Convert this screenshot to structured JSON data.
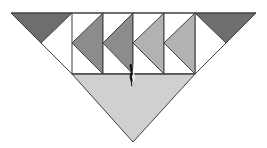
{
  "diagram": {
    "type": "quilt-block-geometric",
    "width": 267,
    "height": 148,
    "colors": {
      "background": "#ffffff",
      "stroke": "#404040",
      "dark": "#6e6e6e",
      "medium": "#8c8c8c",
      "light": "#b2b2b2",
      "base": "#d0d0d0"
    },
    "corner_triangles": [
      {
        "points": "11,13 72,13 41,43",
        "fill": "dark"
      },
      {
        "points": "195,13 256,13 226,43",
        "fill": "dark"
      }
    ],
    "panels": [
      {
        "x": 72,
        "y": 13,
        "w": 31,
        "h": 61,
        "arrow_points": "103,13 72,43 103,74",
        "fill": "medium"
      },
      {
        "x": 103,
        "y": 13,
        "w": 30,
        "h": 61,
        "arrow_points": "133,13 103,43 133,74",
        "fill": "medium"
      },
      {
        "x": 133,
        "y": 13,
        "w": 31,
        "h": 61,
        "arrow_points": "164,13 133,43 164,74",
        "fill": "light"
      },
      {
        "x": 164,
        "y": 13,
        "w": 31,
        "h": 61,
        "arrow_points": "195,13 164,43 195,74",
        "fill": "light"
      }
    ],
    "base_triangle": {
      "points": "72,74 195,74 133,142",
      "fill": "base"
    },
    "outline_lines": [
      {
        "x1": 11,
        "y1": 13,
        "x2": 256,
        "y2": 13
      },
      {
        "x1": 41,
        "y1": 43,
        "x2": 72,
        "y2": 74
      },
      {
        "x1": 226,
        "y1": 43,
        "x2": 195,
        "y2": 74
      },
      {
        "x1": 72,
        "y1": 74,
        "x2": 195,
        "y2": 74
      }
    ]
  }
}
